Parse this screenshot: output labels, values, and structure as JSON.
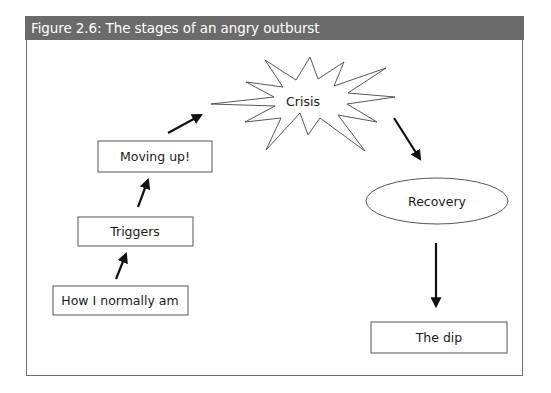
{
  "figure": {
    "title": "Figure 2.6: The stages of an angry outburst",
    "header_color": "#6b6b6b",
    "border_color": "#6e6e6e"
  },
  "nodes": [
    {
      "id": "how-i-normally-am",
      "label": "How I normally am",
      "shape": "rectangle"
    },
    {
      "id": "triggers",
      "label": "Triggers",
      "shape": "rectangle"
    },
    {
      "id": "moving-up",
      "label": "Moving up!",
      "shape": "rectangle"
    },
    {
      "id": "crisis",
      "label": "Crisis",
      "shape": "starburst"
    },
    {
      "id": "recovery",
      "label": "Recovery",
      "shape": "ellipse"
    },
    {
      "id": "the-dip",
      "label": "The dip",
      "shape": "rectangle"
    }
  ],
  "edges": [
    {
      "from": "how-i-normally-am",
      "to": "triggers"
    },
    {
      "from": "triggers",
      "to": "moving-up"
    },
    {
      "from": "moving-up",
      "to": "crisis"
    },
    {
      "from": "crisis",
      "to": "recovery"
    },
    {
      "from": "recovery",
      "to": "the-dip"
    }
  ]
}
